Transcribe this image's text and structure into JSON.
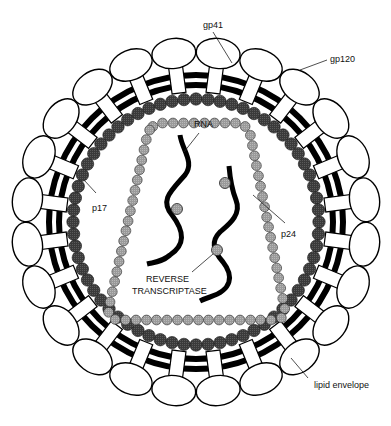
{
  "diagram": {
    "labels": {
      "gp41": "gp41",
      "gp120": "gp120",
      "rna": "RNA",
      "p17": "p17",
      "p24": "p24",
      "reverse_transcriptase_line1": "REVERSE",
      "reverse_transcriptase_line2": "TRANSCRIPTASE",
      "lipid_envelope": "lipid envelope"
    },
    "geometry": {
      "center": [
        196,
        222
      ],
      "envelope_outer_radius": 147,
      "envelope_inner_radius": 137,
      "envelope_line_width": 6,
      "knob_count": 24,
      "knob_stem_inner_radius": 130,
      "knob_stem_outer_radius": 158,
      "knob_head_center_radius": 170,
      "knob_head_rx": 22,
      "knob_head_ry": 15,
      "knob_stem_width": 14,
      "matrix_radius": 123,
      "matrix_bead_count": 64,
      "matrix_bead_r": 6.2,
      "capsid_corners": [
        [
          150,
          123
        ],
        [
          248,
          123
        ],
        [
          287,
          320
        ],
        [
          106,
          320
        ]
      ],
      "capsid_corner_radius": 14,
      "capsid_bead_spacing": 10.4,
      "capsid_bead_r": 4.9
    },
    "colors": {
      "outline": "#000000",
      "knob_fill": "#ffffff",
      "matrix_bead": "#3c3c3c",
      "capsid_bead": "#9a9a9a",
      "rt_bead": "#9a9a9a",
      "background": "#ffffff"
    }
  }
}
